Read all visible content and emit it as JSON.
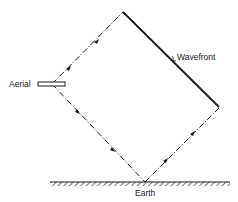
{
  "diagram": {
    "labels": {
      "aerial": "Aerial",
      "wavefront": "Wavefront",
      "earth": "Earth"
    },
    "colors": {
      "line": "#1a1a1a",
      "background": "#ffffff"
    },
    "elements": [
      "aerial (antenna) drawn as a short double bar at left",
      "direct ray: dashed line from aerial up-right to top of wavefront, with direction arrows",
      "reflected ray: dashed line from aerial down-right to earth, reflected up-right to lower end of wavefront, with direction arrows",
      "wavefront: solid line, perpendicular to rays",
      "earth: hatched ground line"
    ]
  }
}
